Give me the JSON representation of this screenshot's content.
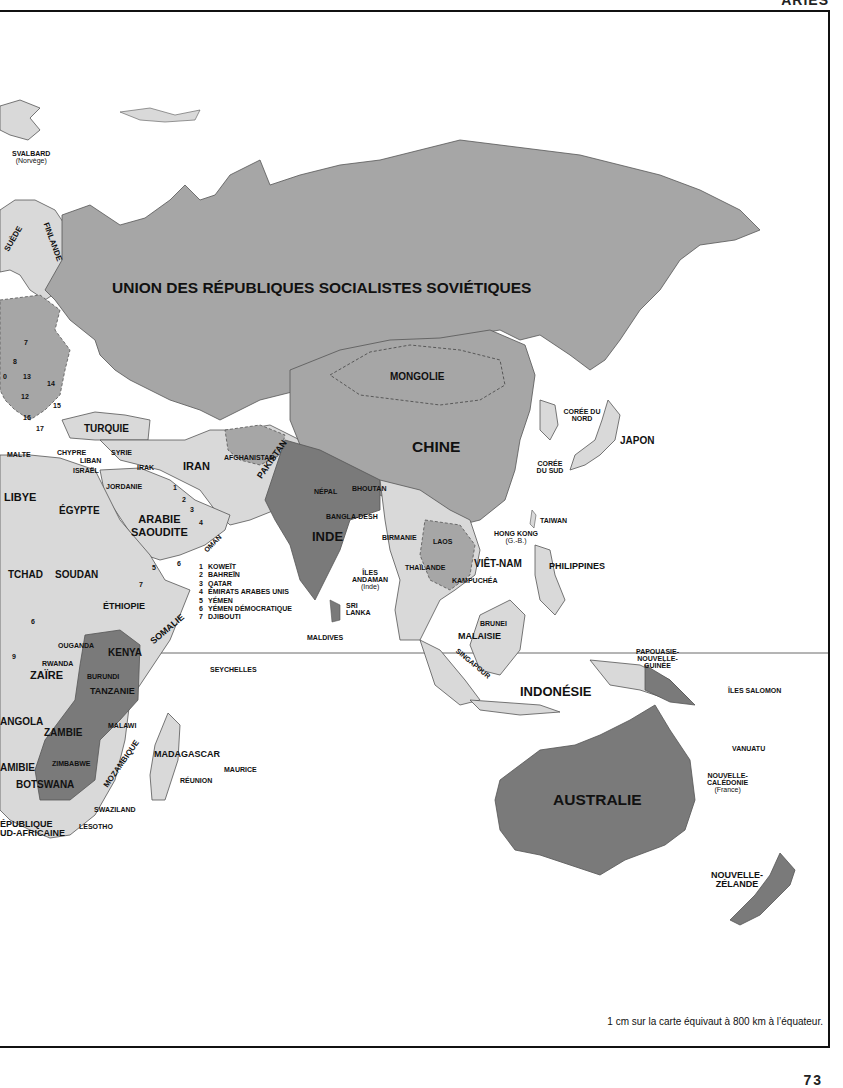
{
  "page": {
    "header_fragment": "ARIES",
    "scale_note": "1 cm sur la carte équivaut à 800 km à l’équateur.",
    "page_number": "73"
  },
  "colors": {
    "dark_country": "#7a7a7a",
    "mid_country": "#a6a6a6",
    "light_country": "#d9d9d9",
    "ocean": "#ffffff",
    "border": "#333333",
    "frame": "#111111"
  },
  "map": {
    "equator_label": "",
    "countries": {
      "urss": "UNION DES RÉPUBLIQUES SOCIALISTES SOVIÉTIQUES",
      "mongolie": "MONGOLIE",
      "chine": "CHINE",
      "japon": "JAPON",
      "coree_nord": "CORÉE DU NORD",
      "coree_sud": "CORÉE DU SUD",
      "taiwan": "TAIWAN",
      "hong_kong": "HONG KONG",
      "hong_kong_sub": "(G.-B.)",
      "inde": "INDE",
      "pakistan": "PAKISTAN",
      "afghanistan": "AFGHANISTAN",
      "iran": "IRAN",
      "irak": "IRAK",
      "syrie": "SYRIE",
      "turquie": "TURQUIE",
      "chypre": "CHYPRE",
      "liban": "LIBAN",
      "israel": "ISRAËL",
      "jordanie": "JORDANIE",
      "arabie": "ARABIE",
      "saoudite": "SAOUDITE",
      "oman": "OMAN",
      "nepal": "NÉPAL",
      "bhoutan": "BHOUTAN",
      "bangladesh": "BANGLA-DESH",
      "birmanie": "BIRMANIE",
      "laos": "LAOS",
      "thailande": "THAÏLANDE",
      "kampuchea": "KAMPUCHÉA",
      "vietnam": "VIÊT-NAM",
      "philippines": "PHILIPPINES",
      "sri_lanka_1": "SRI",
      "sri_lanka_2": "LANKA",
      "andaman_1": "ÎLES",
      "andaman_2": "ANDAMAN",
      "andaman_sub": "(Inde)",
      "maldives": "MALDIVES",
      "brunei": "BRUNEI",
      "malaisie": "MALAISIE",
      "singapour": "SINGAPOUR",
      "indonesie": "INDONÉSIE",
      "papouasie_1": "PAPOUASIE-",
      "papouasie_2": "NOUVELLE-",
      "papouasie_3": "GUINÉE",
      "iles_salomon": "ÎLES SALOMON",
      "vanuatu": "VANUATU",
      "nc_1": "NOUVELLE-",
      "nc_2": "CALÉDONIE",
      "nc_sub": "(France)",
      "australie": "AUSTRALIE",
      "nz_1": "NOUVELLE-",
      "nz_2": "ZÉLANDE",
      "svalbard": "SVALBARD",
      "svalbard_sub": "(Norvège)",
      "suede": "SUÈDE",
      "finlande": "FINLANDE",
      "malte": "MALTE",
      "libye": "LIBYE",
      "egypte": "ÉGYPTE",
      "tchad": "TCHAD",
      "soudan": "SOUDAN",
      "ethiopie": "ÉTHIOPIE",
      "somalie": "SOMALIE",
      "ouganda": "OUGANDA",
      "kenya": "KENYA",
      "rwanda": "RWANDA",
      "burundi": "BURUNDI",
      "zaire": "ZAÏRE",
      "tanzanie": "TANZANIE",
      "angola": "ANGOLA",
      "zambie": "ZAMBIE",
      "malawi": "MALAWI",
      "mozambique": "MOZAMBIQUE",
      "namibie": "AMIBIE",
      "zimbabwe": "ZIMBABWE",
      "botswana": "BOTSWANA",
      "madagascar": "MADAGASCAR",
      "maurice": "MAURICE",
      "reunion": "RÉUNION",
      "swaziland": "SWAZILAND",
      "lesotho": "LESOTHO",
      "afrique_sud_1": "ÉPUBLIQUE",
      "afrique_sud_2": "UD-AFRICAINE",
      "seychelles": "SEYCHELLES"
    },
    "europe_numbers": [
      "7",
      "8",
      "0",
      "13",
      "14",
      "12",
      "15",
      "16",
      "17"
    ],
    "africa_numbers": [
      "6",
      "9"
    ],
    "gulf_numbers": [
      "1",
      "2",
      "3",
      "4",
      "5",
      "6",
      "7"
    ],
    "legend": [
      {
        "n": "1",
        "label": "KOWEÏT"
      },
      {
        "n": "2",
        "label": "BAHREÏN"
      },
      {
        "n": "3",
        "label": "QATAR"
      },
      {
        "n": "4",
        "label": "ÉMIRATS ARABES UNIS"
      },
      {
        "n": "5",
        "label": "YÉMEN"
      },
      {
        "n": "6",
        "label": "YÉMEN DÉMOCRATIQUE"
      },
      {
        "n": "7",
        "label": "DJIBOUTI"
      }
    ]
  }
}
